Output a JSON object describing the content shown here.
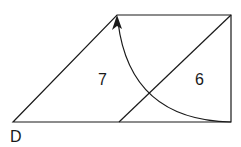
{
  "diagram": {
    "type": "geometry-rotation",
    "shape": "trapezoid divided into triangle and parallelogram",
    "labels": {
      "region_left": "7",
      "region_right": "6",
      "vertex_bottom_left": "D"
    },
    "stroke_color": "#1a1a1a",
    "background": "#ffffff",
    "arrow": "curved arc from bottom-right corner to top-left vertex with arrowhead"
  }
}
